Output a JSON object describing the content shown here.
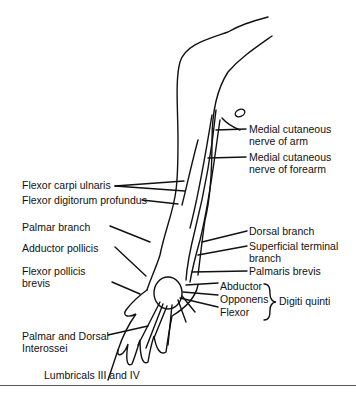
{
  "diagram": {
    "labels": {
      "medial_cutaneous_arm_1": "Medial cutaneous",
      "medial_cutaneous_arm_2": "nerve of arm",
      "medial_cutaneous_forearm_1": "Medial cutaneous",
      "medial_cutaneous_forearm_2": "nerve of forearm",
      "flexor_carpi_ulnaris": "Flexor carpi ulnaris",
      "flexor_digitorum_profundus": "Flexor digitorum profundus",
      "palmar_branch": "Palmar branch",
      "adductor_pollicis": "Adductor pollicis",
      "flexor_pollicis_brevis_1": "Flexor pollicis",
      "flexor_pollicis_brevis_2": "brevis",
      "dorsal_branch": "Dorsal branch",
      "superficial_terminal_1": "Superficial terminal",
      "superficial_terminal_2": "branch",
      "palmaris_brevis": "Palmaris brevis",
      "abductor": "Abductor",
      "opponens": "Opponens",
      "flexor": "Flexor",
      "digiti_quinti": "Digiti quinti",
      "interossei_1": "Palmar and Dorsal",
      "interossei_2": "Interossei",
      "lumbricals": "Lumbricals III and IV"
    }
  }
}
